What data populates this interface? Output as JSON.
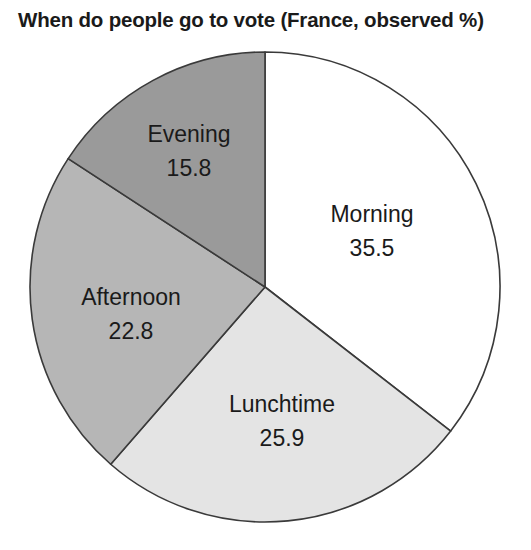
{
  "chart_data": {
    "type": "pie",
    "title": "When do people go to vote (France, observed %)",
    "xlabel": "",
    "ylabel": "",
    "legend": "none",
    "grid": false,
    "units": "percent",
    "start_angle_deg": 0,
    "direction": "clockwise",
    "total": 100.0,
    "categories": [
      "Morning",
      "Lunchtime",
      "Afternoon",
      "Evening"
    ],
    "values": [
      35.5,
      25.9,
      22.8,
      15.8
    ],
    "slices": [
      {
        "label": "Morning",
        "value": "35.5",
        "value_num": 35.5,
        "color": "#ffffff",
        "label_x": 372,
        "label_name_y": 222,
        "label_value_y": 256
      },
      {
        "label": "Lunchtime",
        "value": "25.9",
        "value_num": 25.9,
        "color": "#e4e4e4",
        "label_x": 282,
        "label_name_y": 412,
        "label_value_y": 446
      },
      {
        "label": "Afternoon",
        "value": "22.8",
        "value_num": 22.8,
        "color": "#b6b6b6",
        "label_x": 131,
        "label_name_y": 305,
        "label_value_y": 339
      },
      {
        "label": "Evening",
        "value": "15.8",
        "value_num": 15.8,
        "color": "#9a9a9a",
        "label_x": 189,
        "label_name_y": 142,
        "label_value_y": 176
      }
    ],
    "geometry": {
      "center_x": 265,
      "center_y": 287,
      "radius": 235
    },
    "outline_color": "#3a3a3a"
  }
}
